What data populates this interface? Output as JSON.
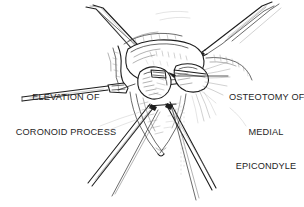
{
  "figure": {
    "kind": "surgical-anatomical-line-illustration",
    "background_color": "#ffffff",
    "ink_color": "#262626",
    "width": 304,
    "height": 207
  },
  "annotations": {
    "left": {
      "id": "elevation-of-coronoid-process",
      "lines": [
        "ELEVATION OF",
        "CORONOID PROCESS"
      ],
      "leader": "line from label right edge up-right to the coronoid process in the wound"
    },
    "right": {
      "id": "osteotomy-of-medial-epicondyle",
      "lines": [
        "OSTEOTOMY OF",
        "MEDIAL",
        "EPICONDYLE"
      ],
      "leader": "horizontal line from label left edge to the osteotomized medial epicondyle"
    }
  },
  "signature": {
    "text": "artist signature"
  },
  "drawing_elements": [
    {
      "name": "elevator-instrument-upper-left",
      "description": "periosteal elevator entering wound from upper left"
    },
    {
      "name": "forceps-instrument-upper-right",
      "description": "fine forceps entering from upper right"
    },
    {
      "name": "retractor-left",
      "description": "retractor blade pulling tissue to the left"
    },
    {
      "name": "retractor-lower",
      "description": "retractor shafts crossing at lower center"
    },
    {
      "name": "humerus-distal",
      "description": "distal humerus bone surface"
    },
    {
      "name": "medial-epicondyle-fragment",
      "description": "osteotomized medial epicondyle fragment"
    },
    {
      "name": "coronoid-process",
      "description": "coronoid process of the ulna being elevated"
    },
    {
      "name": "soft-tissue-flaps",
      "description": "hatched soft tissue and muscle flaps around the wound"
    },
    {
      "name": "skin-edges",
      "description": "incised skin edges of the surgical exposure"
    }
  ]
}
